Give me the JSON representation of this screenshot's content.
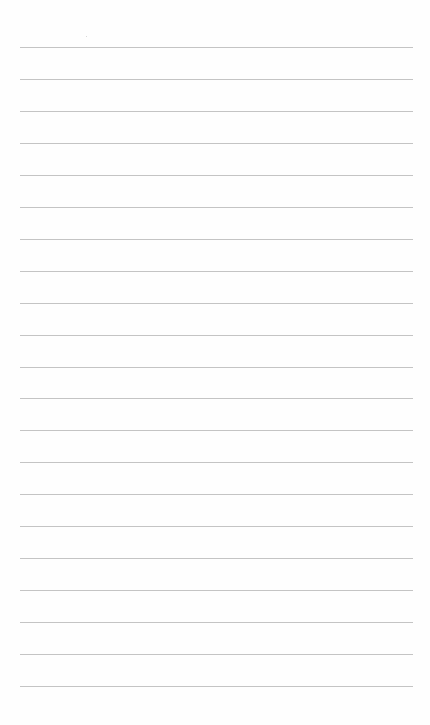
{
  "document": {
    "type": "lined-paper",
    "background_color": "#fefefe",
    "line_color": "#c4c4c4",
    "line_count": 21,
    "first_line_y": 47,
    "line_spacing": 31.95,
    "margin_left": 20,
    "margin_right": 17,
    "lines_text": [
      "",
      "",
      "",
      "",
      "",
      "",
      "",
      "",
      "",
      "",
      "",
      "",
      "",
      "",
      "",
      "",
      "",
      "",
      "",
      "",
      ""
    ]
  }
}
